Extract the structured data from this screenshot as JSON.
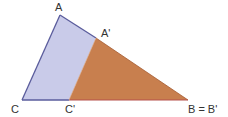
{
  "diagram": {
    "type": "geometry",
    "colors": {
      "blue_fill": "#c9cbe9",
      "blue_stroke": "#5a5c9c",
      "orange_fill": "#c87f4e",
      "orange_stroke": "#b5683a",
      "label": "#333333"
    },
    "points": {
      "A": {
        "label": "A",
        "x": 60,
        "y": 15
      },
      "A_prime": {
        "label": "A'",
        "x": 96,
        "y": 38
      },
      "C": {
        "label": "C",
        "x": 22,
        "y": 100
      },
      "C_prime": {
        "label": "C'",
        "x": 69,
        "y": 100
      },
      "B": {
        "label": "B = B'",
        "x": 188,
        "y": 100
      }
    },
    "labels": {
      "A": "A",
      "A_prime": "A'",
      "C": "C",
      "C_prime": "C'",
      "B": "B = B'"
    }
  }
}
